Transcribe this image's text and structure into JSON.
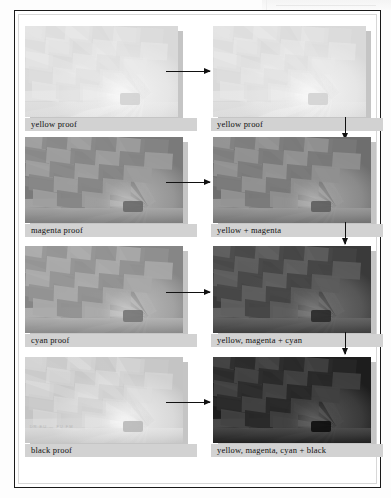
{
  "figure": {
    "image_subject": "interior of a hot-air balloon envelope"
  },
  "columns": {
    "left_label": "separation proofs",
    "right_label": "progressive overprints"
  },
  "rows": [
    {
      "id": "yellow",
      "left": {
        "caption": "yellow proof",
        "ink": "yellow",
        "tone": "very light",
        "base_color": "#e8e8e8",
        "ink_color": "#d9d9d9"
      },
      "right": {
        "caption": "yellow proof",
        "inks": "yellow",
        "tone": "very light",
        "base_color": "#e8e8e8",
        "ink_color": "#d9d9d9"
      },
      "arrow_across": "right-arrow",
      "arrow_down": "down-arrow"
    },
    {
      "id": "magenta",
      "left": {
        "caption": "magenta proof",
        "ink": "magenta",
        "tone": "mid",
        "base_color": "#9a9a9a",
        "ink_color": "#7a7a7a"
      },
      "right": {
        "caption": "yellow + magenta",
        "inks": "yellow, magenta",
        "tone": "mid",
        "base_color": "#8e8e8e",
        "ink_color": "#6e6e6e"
      },
      "arrow_across": "right-arrow",
      "arrow_down": "down-arrow"
    },
    {
      "id": "cyan",
      "left": {
        "caption": "cyan proof",
        "ink": "cyan",
        "tone": "mid-light",
        "base_color": "#a6a6a6",
        "ink_color": "#868686"
      },
      "right": {
        "caption": "yellow, magenta + cyan",
        "inks": "yellow, magenta, cyan",
        "tone": "dark",
        "base_color": "#5a5a5a",
        "ink_color": "#3a3a3a"
      },
      "arrow_across": "right-arrow",
      "arrow_down": "down-arrow"
    },
    {
      "id": "black",
      "left": {
        "caption": "black proof",
        "ink": "black",
        "tone": "very light",
        "base_color": "#dcdcdc",
        "ink_color": "#c4c4c4"
      },
      "right": {
        "caption": "yellow, magenta, cyan + black",
        "inks": "yellow, magenta, cyan, black",
        "tone": "darkest",
        "base_color": "#3e3e3e",
        "ink_color": "#1d1d1d"
      },
      "arrow_across": "right-arrow",
      "arrow_down": null
    }
  ],
  "black_plate_marks": {
    "text": "DR  EU — FU FM"
  },
  "colors": {
    "frame_rule": "#1a1a1a",
    "caption_bar": "#d2d2d2",
    "caption_text": "#111111",
    "arrow": "#111111",
    "page": "#ffffff",
    "shadow": "#969696"
  }
}
